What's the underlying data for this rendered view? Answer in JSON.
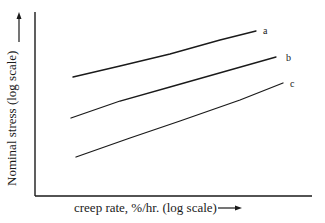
{
  "chart_data": {
    "type": "line",
    "title": "",
    "xlabel": "creep rate, %/hr. (log scale)",
    "ylabel": "Nominal stress (log scale)",
    "x_arrow": "→",
    "y_arrow": "→",
    "grid": false,
    "ticks": false,
    "legend_position": "inline labels at right end of lines",
    "series": [
      {
        "name": "a",
        "points": [
          [
            73,
            77
          ],
          [
            120,
            66
          ],
          [
            170,
            54
          ],
          [
            220,
            40
          ],
          [
            256,
            31
          ]
        ]
      },
      {
        "name": "b",
        "points": [
          [
            71,
            118
          ],
          [
            120,
            101
          ],
          [
            170,
            87
          ],
          [
            230,
            70
          ],
          [
            276,
            57
          ]
        ]
      },
      {
        "name": "c",
        "points": [
          [
            76,
            157
          ],
          [
            130,
            138
          ],
          [
            180,
            121
          ],
          [
            240,
            100
          ],
          [
            283,
            83
          ]
        ]
      }
    ],
    "label_positions": {
      "a": [
        263,
        34
      ],
      "b": [
        286,
        61
      ],
      "c": [
        290,
        87
      ]
    },
    "note": "Schematic plot without numeric tick values; points are pixel coordinates (y downward)."
  },
  "colors": {
    "ink": "#1a1a1a",
    "background": "#ffffff"
  }
}
